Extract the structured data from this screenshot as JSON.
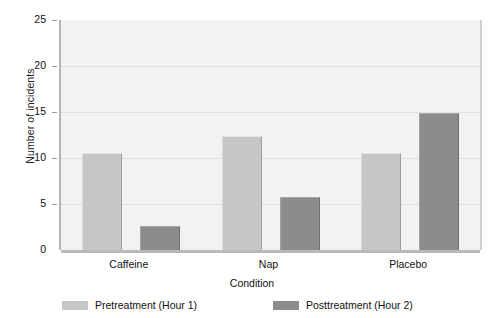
{
  "chart_data": {
    "type": "bar",
    "title": "",
    "subtitle": "",
    "xlabel": "Condition",
    "ylabel": "Number of incidents",
    "categories": [
      "Caffeine",
      "Nap",
      "Placebo"
    ],
    "series": [
      {
        "name": "Pretreatment (Hour 1)",
        "color": "#c6c6c6",
        "values": [
          10.5,
          12.4,
          10.5
        ]
      },
      {
        "name": "Posttreatment (Hour 2)",
        "color": "#8c8c8c",
        "values": [
          2.6,
          5.8,
          14.9
        ]
      }
    ],
    "ylim": [
      0,
      25
    ],
    "yticks": [
      0,
      5,
      10,
      15,
      20,
      25
    ],
    "ytick_labels": [
      "0",
      "5",
      "10",
      "15",
      "20",
      "25"
    ],
    "grid": "horizontal",
    "legend_position": "bottom",
    "plot_background": "#f2f2f2",
    "gridline_color": "#e0e0e0",
    "axis_color": "#b4b4b4"
  },
  "axes": {
    "y_title": "Number of incidents",
    "x_title": "Condition",
    "y_labels": [
      "25",
      "20",
      "15",
      "10",
      "5",
      "0"
    ],
    "x_labels": [
      "Caffeine",
      "Nap",
      "Placebo"
    ]
  },
  "legend": {
    "entries": [
      {
        "label": "Pretreatment (Hour 1)",
        "color": "#c6c6c6"
      },
      {
        "label": "Posttreatment (Hour 2)",
        "color": "#8c8c8c"
      }
    ]
  }
}
